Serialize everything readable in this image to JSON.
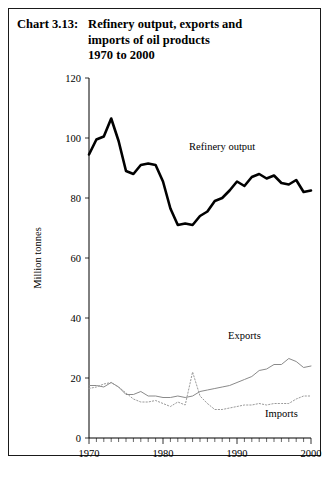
{
  "chart_number": "Chart 3.13:",
  "title_lines": [
    "Refinery output, exports and",
    "imports of oil products",
    "1970 to 2000"
  ],
  "chart_data": {
    "type": "line",
    "title": "Refinery output, exports and imports of oil products 1970 to 2000",
    "xlabel": "",
    "ylabel": "Million tonnes",
    "xlim": [
      1970,
      2000
    ],
    "ylim": [
      0,
      120
    ],
    "ytick_labels": [
      "0",
      "20",
      "40",
      "60",
      "80",
      "100",
      "120"
    ],
    "yticks": [
      0,
      20,
      40,
      60,
      80,
      100,
      120
    ],
    "xtick_labels": [
      "1970",
      "1980",
      "1990",
      "2000"
    ],
    "xticks": [
      1970,
      1980,
      1990,
      2000
    ],
    "minor_xtick_interval": 1,
    "grid": false,
    "legend_position": "inline-annotations",
    "x": [
      1970,
      1971,
      1972,
      1973,
      1974,
      1975,
      1976,
      1977,
      1978,
      1979,
      1980,
      1981,
      1982,
      1983,
      1984,
      1985,
      1986,
      1987,
      1988,
      1989,
      1990,
      1991,
      1992,
      1993,
      1994,
      1995,
      1996,
      1997,
      1998,
      1999,
      2000
    ],
    "series": [
      {
        "name": "Refinery output",
        "style": "solid-thick",
        "color": "#000000",
        "label_x": 1988,
        "label_y": 96,
        "values": [
          94.5,
          99.5,
          100.5,
          106.5,
          99.0,
          89.0,
          88.0,
          91.0,
          91.5,
          91.0,
          85.5,
          76.5,
          71.0,
          71.5,
          71.0,
          74.0,
          75.5,
          79.0,
          80.0,
          82.5,
          85.5,
          84.0,
          87.0,
          88.0,
          86.5,
          87.5,
          85.0,
          84.5,
          86.0,
          82.0,
          82.5
        ]
      },
      {
        "name": "Exports",
        "style": "solid-thin",
        "color": "#8a8a8a",
        "label_x": 1991,
        "label_y": 33,
        "values": [
          17.5,
          17.5,
          17.0,
          18.5,
          17.0,
          14.5,
          14.5,
          15.5,
          14.0,
          14.0,
          13.5,
          13.5,
          14.0,
          13.5,
          14.0,
          15.5,
          16.0,
          16.5,
          17.0,
          17.5,
          18.5,
          19.5,
          20.5,
          22.5,
          23.0,
          24.5,
          24.5,
          26.5,
          25.5,
          23.5,
          24.0
        ]
      },
      {
        "name": "Imports",
        "style": "dotted",
        "color": "#9a9a9a",
        "label_x": 1996,
        "label_y": 7,
        "values": [
          16.5,
          17.0,
          18.0,
          18.5,
          17.0,
          15.0,
          13.0,
          12.0,
          12.0,
          12.5,
          11.5,
          10.5,
          12.0,
          11.0,
          22.0,
          14.0,
          11.5,
          9.5,
          9.5,
          10.0,
          10.5,
          11.0,
          11.0,
          11.5,
          11.0,
          11.5,
          11.5,
          11.5,
          13.0,
          14.0,
          14.0
        ]
      }
    ]
  }
}
